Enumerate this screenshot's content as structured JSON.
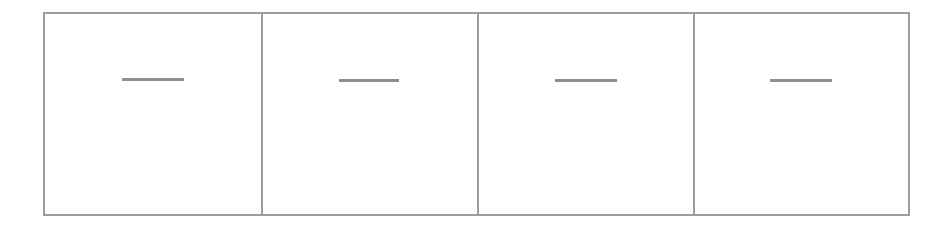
{
  "figure": {
    "type": "four-panel-blank-strip",
    "line_color": "#9d9d9d",
    "dash_color": "#8f8f8f",
    "background": "#ffffff",
    "panels": [
      {
        "index": 1,
        "content": "—"
      },
      {
        "index": 2,
        "content": "—"
      },
      {
        "index": 3,
        "content": "—"
      },
      {
        "index": 4,
        "content": "—"
      }
    ]
  }
}
